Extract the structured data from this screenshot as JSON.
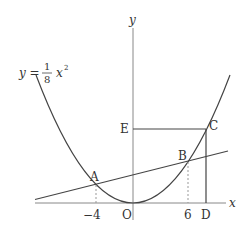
{
  "diagram": {
    "equation": {
      "lhs": "y =",
      "numerator": "1",
      "denominator": "8",
      "rhs": "x",
      "exponent": "2"
    },
    "axes": {
      "x_label": "x",
      "y_label": "y",
      "origin_label": "O"
    },
    "points": {
      "A": "A",
      "B": "B",
      "C": "C",
      "D": "D",
      "E": "E"
    },
    "ticks": {
      "neg4": "−4",
      "six": "6"
    },
    "colors": {
      "stroke": "#444444",
      "axis": "#777777",
      "dashed": "#999999"
    }
  }
}
